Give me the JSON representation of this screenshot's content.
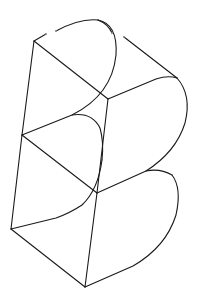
{
  "figure": {
    "background": "#ffffff",
    "stroke_color": "#1a1a1a",
    "stroke_width": 1.1,
    "vertices": {
      "A": [
        34,
        41
      ],
      "B": [
        108,
        99
      ],
      "C": [
        22,
        135
      ],
      "D": [
        97,
        193
      ],
      "E": [
        11,
        229
      ],
      "F": [
        85,
        287
      ]
    },
    "segments": [
      {
        "name": "left-spine-upper",
        "d": "M34,41 L22,135"
      },
      {
        "name": "left-spine-lower",
        "d": "M22,135 L11,229"
      },
      {
        "name": "diag-top",
        "d": "M34,41 L108,99"
      },
      {
        "name": "diag-middle",
        "d": "M22,135 L97,193"
      },
      {
        "name": "diag-bottom",
        "d": "M11,229 L85,287"
      },
      {
        "name": "center-spine-upper",
        "d": "M108,99 L97,193"
      },
      {
        "name": "center-spine-lower",
        "d": "M97,193 L85,287"
      },
      {
        "name": "top-edge-left-stub",
        "d": "M34,41 L46,34"
      },
      {
        "name": "top-edge",
        "d": "M56,31 Q80,18 98,20"
      },
      {
        "name": "top-bowl-front",
        "d": "M98,20 Q118,24 116,55 Q112,95 72,115 L22,135"
      },
      {
        "name": "top-edge-right-stub",
        "d": "M98,20 Q108,24 112,33"
      },
      {
        "name": "upper-back-edge",
        "d": "M124,37 L177,78"
      },
      {
        "name": "upper-mid-edge",
        "d": "M108,99 L156,79 Q168,75 177,78"
      },
      {
        "name": "upper-bowl-back",
        "d": "M177,78 Q192,95 185,123 Q176,152 146,171"
      },
      {
        "name": "lower-top-edge",
        "d": "M97,193 L146,171 Q160,168 172,175"
      },
      {
        "name": "lower-bowl-back",
        "d": "M172,175 Q182,188 176,215 Q166,247 133,266 L85,287"
      },
      {
        "name": "upper-inner-bowl",
        "d": "M72,115 Q92,112 100,128 Q104,142 102,160"
      },
      {
        "name": "lower-inner-bowl",
        "d": "M102,160 Q98,190 82,205 Q70,213 56,218 L11,229"
      }
    ],
    "gaps": [
      {
        "name": "top-left-gap",
        "from": [
          46,
          34
        ],
        "to": [
          56,
          31
        ]
      },
      {
        "name": "top-right-gap",
        "from": [
          112,
          33
        ],
        "to": [
          124,
          37
        ]
      }
    ]
  }
}
